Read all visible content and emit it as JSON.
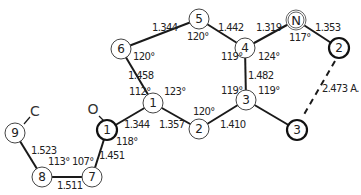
{
  "diagram": {
    "type": "molecular-structure",
    "atoms": [
      {
        "id": "ring-6",
        "label": "6",
        "x": 121,
        "y": 49,
        "style": "normal"
      },
      {
        "id": "ring-5",
        "label": "5",
        "x": 199,
        "y": 19,
        "style": "normal"
      },
      {
        "id": "ring-4",
        "label": "4",
        "x": 245,
        "y": 48,
        "style": "normal"
      },
      {
        "id": "ring-N",
        "label": "N",
        "x": 296,
        "y": 20,
        "style": "double"
      },
      {
        "id": "ring-2b",
        "label": "2",
        "x": 339,
        "y": 48,
        "style": "bold"
      },
      {
        "id": "ring-3",
        "label": "3",
        "x": 246,
        "y": 100,
        "style": "normal"
      },
      {
        "id": "ring-3b",
        "label": "3",
        "x": 297,
        "y": 130,
        "style": "bold"
      },
      {
        "id": "ring-1",
        "label": "1",
        "x": 153,
        "y": 103,
        "style": "normal"
      },
      {
        "id": "ring-2",
        "label": "2",
        "x": 199,
        "y": 129,
        "style": "normal"
      },
      {
        "id": "atom-1b",
        "label": "1",
        "x": 107,
        "y": 130,
        "style": "bold"
      },
      {
        "id": "atom-7",
        "label": "7",
        "x": 92,
        "y": 177,
        "style": "normal"
      },
      {
        "id": "atom-8",
        "label": "8",
        "x": 42,
        "y": 177,
        "style": "normal"
      },
      {
        "id": "atom-9",
        "label": "9",
        "x": 15,
        "y": 133,
        "style": "normal"
      }
    ],
    "elements": [
      {
        "id": "elem-O",
        "label": "O",
        "x": 93,
        "y": 109
      },
      {
        "id": "elem-C",
        "label": "C",
        "x": 35,
        "y": 111
      }
    ],
    "bond_lengths": [
      {
        "id": "b-6-5",
        "text": "1.344",
        "x": 162,
        "y": 28
      },
      {
        "id": "b-5-4",
        "text": "1.442",
        "x": 218,
        "y": 28
      },
      {
        "id": "b-4-N",
        "text": "1.319",
        "x": 257,
        "y": 28
      },
      {
        "id": "b-N-2",
        "text": "1.353",
        "x": 315,
        "y": 28
      },
      {
        "id": "b-6-1",
        "text": "1.458",
        "x": 128,
        "y": 77
      },
      {
        "id": "b-4-3",
        "text": "1.482",
        "x": 248,
        "y": 77
      },
      {
        "id": "b-2-3-dash",
        "text": "2.473 A.",
        "x": 322,
        "y": 89
      },
      {
        "id": "b-1-1b",
        "text": "1.344",
        "x": 126,
        "y": 126
      },
      {
        "id": "b-1-2",
        "text": "1.357",
        "x": 159,
        "y": 126
      },
      {
        "id": "b-2-3",
        "text": "1.410",
        "x": 220,
        "y": 127
      },
      {
        "id": "b-9-8",
        "text": "1.523",
        "x": 31,
        "y": 152
      },
      {
        "id": "b-1b-7",
        "text": "1.451",
        "x": 99,
        "y": 158
      },
      {
        "id": "b-8-7",
        "text": "1.511",
        "x": 57,
        "y": 188
      }
    ],
    "bond_angles": [
      {
        "id": "a-6",
        "text": "120°",
        "x": 134,
        "y": 58
      },
      {
        "id": "a-5",
        "text": "120°",
        "x": 187,
        "y": 37
      },
      {
        "id": "a-4-left",
        "text": "119°",
        "x": 222,
        "y": 58
      },
      {
        "id": "a-4-right",
        "text": "124°",
        "x": 258,
        "y": 58
      },
      {
        "id": "a-N",
        "text": "117°",
        "x": 289,
        "y": 38
      },
      {
        "id": "a-1-left",
        "text": "112°",
        "x": 130,
        "y": 92
      },
      {
        "id": "a-1-right",
        "text": "123°",
        "x": 164,
        "y": 92
      },
      {
        "id": "a-3-left",
        "text": "119°",
        "x": 222,
        "y": 92
      },
      {
        "id": "a-3-right",
        "text": "119°",
        "x": 258,
        "y": 92
      },
      {
        "id": "a-2",
        "text": "120°",
        "x": 193,
        "y": 113
      },
      {
        "id": "a-1b",
        "text": "118°",
        "x": 116,
        "y": 144
      },
      {
        "id": "a-8",
        "text": "113°",
        "x": 48,
        "y": 164
      },
      {
        "id": "a-7",
        "text": "107°",
        "x": 72,
        "y": 164
      }
    ]
  }
}
